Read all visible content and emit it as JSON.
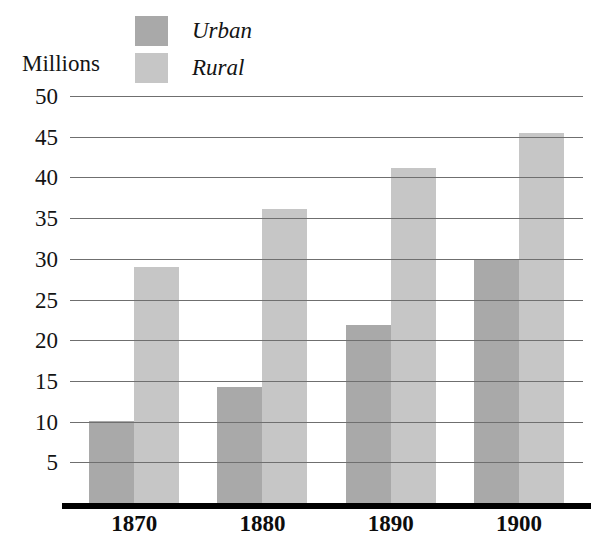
{
  "chart_data": {
    "type": "bar",
    "title": "",
    "subtitle": "",
    "xlabel": "",
    "ylabel": "Millions",
    "categories": [
      "1870",
      "1880",
      "1890",
      "1900"
    ],
    "series": [
      {
        "name": "Urban",
        "color": "#a9a9a9",
        "values": [
          10.1,
          14.2,
          21.9,
          29.9
        ]
      },
      {
        "name": "Rural",
        "color": "#c6c6c6",
        "values": [
          29.0,
          36.1,
          41.1,
          45.4
        ]
      }
    ],
    "ylim": [
      0,
      50
    ],
    "ytick_values": [
      50,
      45,
      40,
      35,
      30,
      25,
      20,
      15,
      10,
      5
    ],
    "ytick_labels": [
      "50",
      "45",
      "40",
      "35",
      "30",
      "25",
      "20",
      "15",
      "10",
      "5"
    ],
    "grid": true,
    "grid_axis": "y",
    "grid_color": "#6f6f6f",
    "legend_position": "top",
    "axis_line_color": "#000000",
    "background_color": "#ffffff",
    "bar_gap_within_group": 0,
    "annotations": []
  },
  "legend": {
    "items": [
      {
        "label": "Urban",
        "swatch_name": "legend-swatch-urban",
        "color": "#a9a9a9"
      },
      {
        "label": "Rural",
        "swatch_name": "legend-swatch-rural",
        "color": "#c6c6c6"
      }
    ]
  },
  "axis": {
    "y_title": "Millions",
    "y_ticks": [
      "50",
      "45",
      "40",
      "35",
      "30",
      "25",
      "20",
      "15",
      "10",
      "5"
    ],
    "x_ticks": [
      "1870",
      "1880",
      "1890",
      "1900"
    ]
  }
}
